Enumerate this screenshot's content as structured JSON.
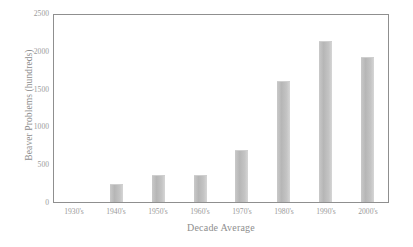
{
  "chart_data": {
    "type": "bar",
    "title": "",
    "xlabel": "Decade Average",
    "ylabel": "Beaver Problems (hundreds)",
    "categories": [
      "1930's",
      "1940's",
      "1950's",
      "1960's",
      "1970's",
      "1980's",
      "1990's",
      "2000's"
    ],
    "values": [
      0,
      240,
      360,
      355,
      690,
      1600,
      2130,
      1920
    ],
    "ylim": [
      0,
      2500
    ],
    "y_ticks": [
      0,
      500,
      1000,
      1500,
      2000,
      2500
    ],
    "y_tick_labels": [
      "0",
      "500",
      "1000",
      "1500",
      "2000",
      "2500"
    ],
    "grid": false,
    "legend": null,
    "series": [
      {
        "name": "Beaver Problems",
        "values": [
          0,
          240,
          360,
          355,
          690,
          1600,
          2130,
          1920
        ]
      }
    ],
    "colors": {
      "bar_fill": "#c0c0c0",
      "axis_line": "#8f8f8f",
      "text": "#9a9a9a",
      "background": "#ffffff"
    }
  }
}
